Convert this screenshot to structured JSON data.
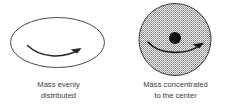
{
  "figure": {
    "type": "two-panel-comparison-diagram",
    "background_color": "#ffffff",
    "ink_color": "#2b2b2b",
    "panels": [
      {
        "id": "evenly-distributed",
        "shape": "ellipse",
        "fill": "none",
        "outline_color": "#4a4a4a",
        "has_center_dot": false,
        "rotation_arrow": "curved-arrow-pointing-right",
        "caption_line1": "Mass evenly",
        "caption_line2": "distributed"
      },
      {
        "id": "concentrated-to-center",
        "shape": "circle",
        "fill": "crosshatch-stipple",
        "fill_color": "#8c8c8c",
        "outline_color": "#3a3a3a",
        "has_center_dot": true,
        "center_dot_color": "#111111",
        "rotation_arrow": "curved-arrow-pointing-right",
        "caption_line1": "Mass concentrated",
        "caption_line2": "to the center"
      }
    ]
  }
}
